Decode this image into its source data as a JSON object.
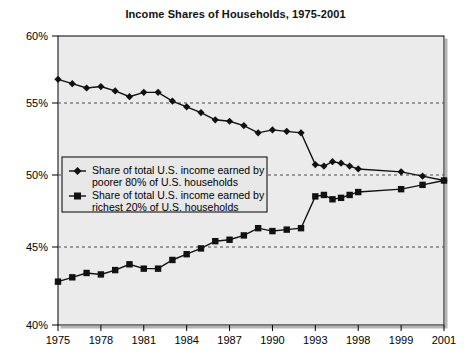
{
  "chart_data": {
    "type": "line",
    "title": "Income Shares of Households, 1975-2001",
    "xlabel": "",
    "ylabel": "",
    "ylim": [
      40,
      60
    ],
    "xlim": [
      1975,
      2001
    ],
    "ytick_labels": [
      "60%",
      "55%",
      "50%",
      "45%",
      "40%"
    ],
    "ytick_values": [
      60,
      55,
      50,
      45,
      40
    ],
    "xtick_labels": [
      "1975",
      "1978",
      "1981",
      "1984",
      "1987",
      "1990",
      "1993",
      "1998",
      "1999",
      "2001"
    ],
    "xtick_values": [
      1975,
      1978,
      1981,
      1984,
      1987,
      1990,
      1993,
      1998,
      1999,
      2001
    ],
    "grid": "horizontal-dashed",
    "legend_position": "center-left-inside",
    "x": [
      1975,
      1976,
      1977,
      1978,
      1979,
      1980,
      1981,
      1982,
      1983,
      1984,
      1985,
      1986,
      1987,
      1988,
      1989,
      1990,
      1991,
      1992,
      1993,
      1994,
      1995,
      1996,
      1997,
      1998,
      1999,
      2000,
      2001
    ],
    "series": [
      {
        "name": "Share of total U.S. income earned by poorer 80% of U.S. households",
        "marker": "diamond",
        "values": [
          57.0,
          56.7,
          56.4,
          56.5,
          56.2,
          55.8,
          56.1,
          56.1,
          55.5,
          55.1,
          54.7,
          54.2,
          54.1,
          53.8,
          53.3,
          53.5,
          53.4,
          53.3,
          51.1,
          51.0,
          51.3,
          51.2,
          51.0,
          50.8,
          50.6,
          50.3,
          50.0
        ]
      },
      {
        "name": "Share of total U.S. income earned by richest 20% of U.S. households",
        "marker": "square",
        "values": [
          43.0,
          43.3,
          43.6,
          43.5,
          43.8,
          44.2,
          43.9,
          43.9,
          44.5,
          44.9,
          45.3,
          45.8,
          45.9,
          46.2,
          46.7,
          46.5,
          46.6,
          46.7,
          48.9,
          49.0,
          48.7,
          48.8,
          49.0,
          49.2,
          49.4,
          49.7,
          50.0
        ]
      }
    ]
  },
  "legend": {
    "entries": [
      {
        "marker": "diamond",
        "line1": "Share of total U.S. income earned by",
        "line2": "poorer 80% of U.S. households"
      },
      {
        "marker": "square",
        "line1": "Share of total U.S. income earned by",
        "line2": "richest 20% of U.S. households"
      }
    ]
  },
  "colors": {
    "plot_background": "#ebebeb",
    "series_line": "#111111",
    "grid_line": "#555555",
    "axis_line": "#000000",
    "page_background": "#ffffff",
    "legend_background": "#e8e8e8"
  }
}
